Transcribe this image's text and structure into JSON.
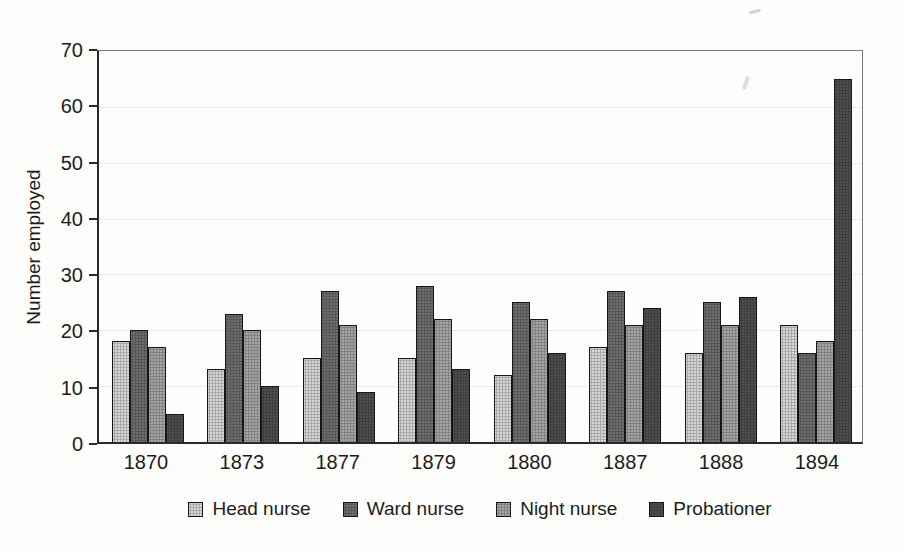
{
  "chart_data": {
    "type": "bar",
    "title": "",
    "xlabel": "",
    "ylabel": "Number employed",
    "ylim": [
      0,
      70
    ],
    "y_ticks": [
      0,
      10,
      20,
      30,
      40,
      50,
      60,
      70
    ],
    "grid": "horizontal-faint",
    "legend_position": "bottom-center",
    "categories": [
      "1870",
      "1873",
      "1877",
      "1879",
      "1880",
      "1887",
      "1888",
      "1894"
    ],
    "series": [
      {
        "name": "Head nurse",
        "color": "#d8d8d6",
        "values": [
          18,
          13,
          15,
          15,
          12,
          17,
          16,
          21
        ]
      },
      {
        "name": "Ward nurse",
        "color": "#6e6e6e",
        "values": [
          20,
          23,
          27,
          28,
          25,
          27,
          25,
          16
        ]
      },
      {
        "name": "Night nurse",
        "color": "#a6a6a4",
        "values": [
          17,
          20,
          21,
          22,
          22,
          21,
          21,
          18
        ]
      },
      {
        "name": "Probationer",
        "color": "#4f4f4f",
        "values": [
          5,
          10,
          9,
          13,
          16,
          24,
          26,
          65
        ]
      }
    ]
  }
}
